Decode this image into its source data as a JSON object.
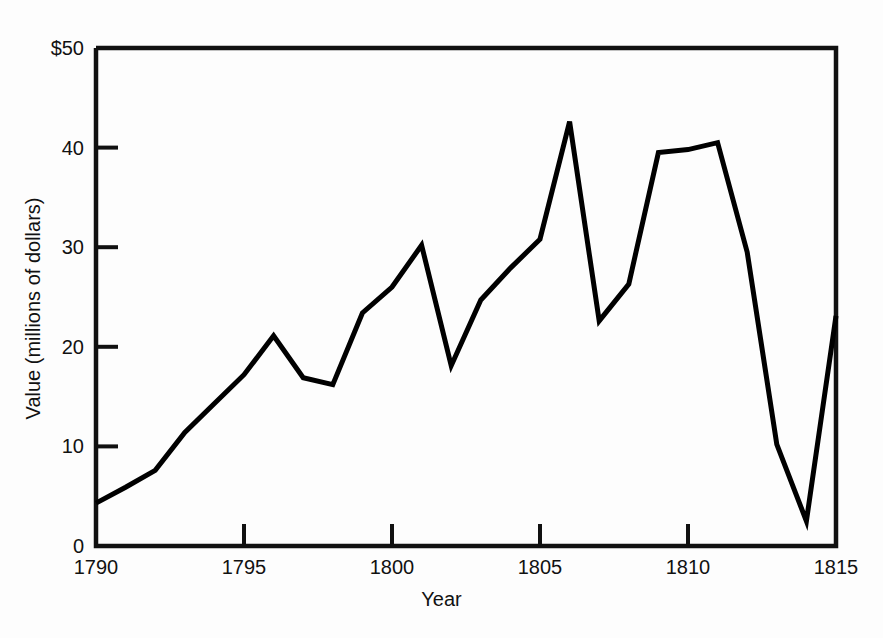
{
  "chart_data": {
    "type": "line",
    "title": "",
    "xlabel": "Year",
    "ylabel": "Value (millions of dollars)",
    "xlim": [
      1790,
      1815
    ],
    "ylim": [
      0,
      50
    ],
    "grid": false,
    "legend": null,
    "x_ticks": [
      "1790",
      "1795",
      "1800",
      "1805",
      "1810",
      "1815"
    ],
    "x_tick_values": [
      1790,
      1795,
      1800,
      1805,
      1810,
      1815
    ],
    "y_ticks": [
      "0",
      "10",
      "20",
      "30",
      "40",
      "$50"
    ],
    "y_tick_values": [
      0,
      10,
      20,
      30,
      40,
      50
    ],
    "x": [
      1790,
      1791,
      1792,
      1793,
      1794,
      1795,
      1796,
      1797,
      1798,
      1799,
      1800,
      1801,
      1802,
      1803,
      1804,
      1805,
      1806,
      1807,
      1808,
      1809,
      1810,
      1811,
      1812,
      1813,
      1814,
      1815
    ],
    "values": [
      4.3,
      5.9,
      7.6,
      11.4,
      14.3,
      17.2,
      21.1,
      16.9,
      16.2,
      23.4,
      26.0,
      30.2,
      18.1,
      24.7,
      27.9,
      30.8,
      42.6,
      22.6,
      26.3,
      39.5,
      39.8,
      40.5,
      29.5,
      10.2,
      2.5,
      23.1
    ],
    "series": [
      {
        "name": "Value",
        "color": "#000000",
        "line_width": 5,
        "values": [
          4.3,
          5.9,
          7.6,
          11.4,
          14.3,
          17.2,
          21.1,
          16.9,
          16.2,
          23.4,
          26.0,
          30.2,
          18.1,
          24.7,
          27.9,
          30.8,
          42.6,
          22.6,
          26.3,
          39.5,
          39.8,
          40.5,
          29.5,
          10.2,
          2.5,
          23.1
        ]
      }
    ],
    "annotations": []
  },
  "axes": {
    "y_title": "Value (millions of dollars)",
    "x_title": "Year"
  }
}
